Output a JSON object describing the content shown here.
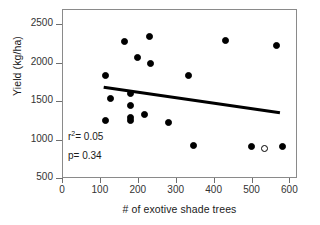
{
  "chart_data": {
    "type": "scatter",
    "title": "",
    "xlabel": "# of exotive shade trees",
    "ylabel": "Yield (kg/ha)",
    "xlim": [
      0,
      620
    ],
    "ylim": [
      500,
      2700
    ],
    "xticks": [
      0,
      100,
      200,
      300,
      400,
      500,
      600
    ],
    "xtick_labels": [
      "0",
      "100",
      "200",
      "300",
      "400",
      "500",
      "600"
    ],
    "yticks": [
      500,
      1000,
      1500,
      2000,
      2500
    ],
    "ytick_labels": [
      "500",
      "1000",
      "1500",
      "2000",
      "2500"
    ],
    "grid": false,
    "legend": "none",
    "series": [
      {
        "name": "filled",
        "marker": "filled-circle",
        "color": "#000000",
        "points": [
          {
            "x": 115,
            "y": 1830
          },
          {
            "x": 115,
            "y": 1255
          },
          {
            "x": 128,
            "y": 1535
          },
          {
            "x": 165,
            "y": 2275
          },
          {
            "x": 182,
            "y": 1595
          },
          {
            "x": 182,
            "y": 1440
          },
          {
            "x": 182,
            "y": 1290
          },
          {
            "x": 182,
            "y": 1255
          },
          {
            "x": 200,
            "y": 2070
          },
          {
            "x": 218,
            "y": 1330
          },
          {
            "x": 232,
            "y": 2340
          },
          {
            "x": 234,
            "y": 1985
          },
          {
            "x": 282,
            "y": 1225
          },
          {
            "x": 333,
            "y": 1840
          },
          {
            "x": 348,
            "y": 920
          },
          {
            "x": 432,
            "y": 2285
          },
          {
            "x": 500,
            "y": 905
          },
          {
            "x": 566,
            "y": 2230
          },
          {
            "x": 583,
            "y": 915
          }
        ]
      },
      {
        "name": "open",
        "marker": "open-circle",
        "color": "#ffffff",
        "points": [
          {
            "x": 534,
            "y": 890
          }
        ]
      }
    ],
    "trendline": {
      "type": "linear",
      "x_start": 110,
      "y_start": 1680,
      "x_end": 575,
      "y_end": 1350,
      "color": "#000000",
      "width": 3
    },
    "annotations": [
      {
        "id": "r2",
        "text_prefix": "r",
        "text_superscript": "2",
        "text_suffix": "= 0.05",
        "x": 68,
        "y": 130
      },
      {
        "id": "p",
        "text": "p= 0.34",
        "x": 68,
        "y": 150
      }
    ]
  }
}
